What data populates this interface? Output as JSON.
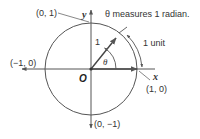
{
  "diagram": {
    "caption": "θ measures 1 radian.",
    "arc_label": "1 unit",
    "radius_label": "1",
    "angle_label": "θ",
    "origin_label": "O",
    "x_axis_label": "x",
    "y_axis_label": "y",
    "points": {
      "top": "(0, 1)",
      "left": "(−1, 0)",
      "right": "(1, 0)",
      "bottom": "(0, −1)"
    },
    "angle_radians": 1,
    "radius_units": 1,
    "colors": {
      "line": "#555555",
      "text": "#333333",
      "background": "#ffffff"
    }
  }
}
